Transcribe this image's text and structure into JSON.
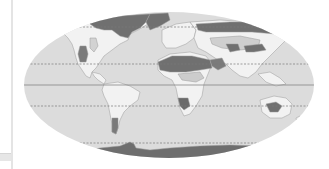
{
  "map": {
    "title": "",
    "projection": "robinson-like",
    "colors": {
      "ocean": "#dcdcdc",
      "land_light": "#f4f4f4",
      "land_mid": "#c8c8c8",
      "land_dark": "#6e6e6e",
      "coast": "#9a9a9a",
      "line": "#7a7a7a"
    },
    "reference_lines": [
      {
        "name": "arctic-circle",
        "style": "dashed",
        "y": 27
      },
      {
        "name": "tropic-of-cancer",
        "style": "dashed",
        "y": 64
      },
      {
        "name": "equator",
        "style": "solid",
        "y": 85
      },
      {
        "name": "tropic-of-capricorn",
        "style": "dashed",
        "y": 106
      },
      {
        "name": "antarctic-circle",
        "style": "dashed",
        "y": 143
      }
    ]
  }
}
